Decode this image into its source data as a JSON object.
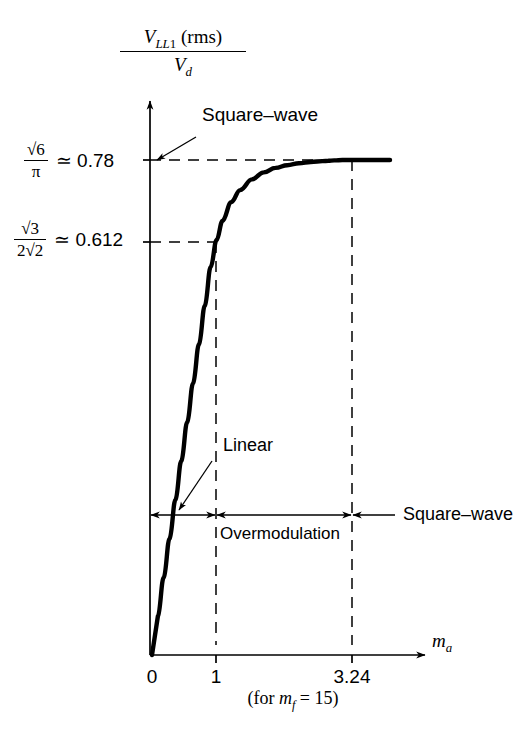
{
  "figure": {
    "type": "line-chart",
    "background": "#ffffff",
    "ink_color": "#000000"
  },
  "yaxis": {
    "label_numerator_v": "V",
    "label_numerator_sub": "LL",
    "label_numerator_sub2": "1",
    "label_numerator_rms": "(rms)",
    "label_denominator_v": "V",
    "label_denominator_sub": "d",
    "ticks": [
      {
        "name": "square-wave-limit",
        "num": "√6",
        "den": "π",
        "approx": "≃ 0.78",
        "value": 0.78
      },
      {
        "name": "linear-limit",
        "num": "√3",
        "den": "2√2",
        "approx": "≃ 0.612",
        "value": 0.612
      }
    ]
  },
  "xaxis": {
    "label_m": "m",
    "label_sub": "a",
    "ticks": [
      "0",
      "1",
      "3.24"
    ],
    "tick_values": [
      0,
      1,
      3.24
    ],
    "note_prefix": "(for ",
    "note_m": "m",
    "note_sub": "f",
    "note_suffix": " = 15)"
  },
  "annotations": {
    "square_wave_callout": "Square–wave",
    "linear_callout": "Linear",
    "overmodulation_region": "Overmodulation",
    "square_wave_region": "Square–wave"
  },
  "chart_data": {
    "type": "line",
    "title": "",
    "xlabel": "m_a",
    "ylabel": "V_LL1(rms) / V_d",
    "xlim": [
      0,
      4.05
    ],
    "ylim": [
      0,
      0.855
    ],
    "grid": false,
    "legend": "none",
    "xticks": [
      0,
      1,
      3.24
    ],
    "xticklabels": [
      "0",
      "1",
      "3.24"
    ],
    "yticks": [
      0.612,
      0.78
    ],
    "yticklabels": [
      "√3/(2√2) ≃ 0.612",
      "√6/π ≃ 0.78"
    ],
    "reference_lines": [
      {
        "axis": "y",
        "value": 0.78,
        "style": "dashed",
        "label": "√6/π ≃ 0.78"
      },
      {
        "axis": "y",
        "value": 0.612,
        "style": "dashed",
        "label": "√3/(2√2) ≃ 0.612"
      },
      {
        "axis": "x",
        "value": 1,
        "style": "dashed",
        "label": "1"
      },
      {
        "axis": "x",
        "value": 3.24,
        "style": "dashed",
        "label": "3.24"
      }
    ],
    "series": [
      {
        "name": "V_LL1(rms)/V_d vs m_a",
        "x": [
          0,
          0.1,
          0.2,
          0.3,
          0.4,
          0.5,
          0.6,
          0.7,
          0.8,
          0.9,
          1.0,
          1.1,
          1.2,
          1.35,
          1.5,
          1.7,
          1.9,
          2.1,
          2.3,
          2.5,
          2.7,
          2.9,
          3.0,
          3.1,
          3.24,
          3.5,
          3.8,
          4.05
        ],
        "y": [
          0,
          0.0612,
          0.1224,
          0.1836,
          0.2448,
          0.306,
          0.3672,
          0.4284,
          0.4896,
          0.5508,
          0.612,
          0.654,
          0.684,
          0.7135,
          0.7325,
          0.7495,
          0.7605,
          0.7675,
          0.7718,
          0.7748,
          0.7768,
          0.7782,
          0.7788,
          0.7793,
          0.78,
          0.78,
          0.78,
          0.78
        ]
      }
    ],
    "regions": [
      {
        "name": "Linear",
        "x_start": 0,
        "x_end": 1
      },
      {
        "name": "Overmodulation",
        "x_start": 1,
        "x_end": 3.24
      },
      {
        "name": "Square–wave",
        "x_start": 3.24,
        "x_end": 4.05
      }
    ]
  }
}
